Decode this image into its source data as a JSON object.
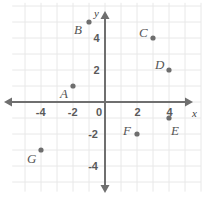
{
  "chart_data": {
    "type": "scatter",
    "title": "",
    "xlabel": "x",
    "ylabel": "y",
    "xlim": [
      -5.8,
      6.0
    ],
    "ylim": [
      -5.6,
      6.2
    ],
    "grid": true,
    "grid_step": 1,
    "axis_tick_step": 2,
    "xticks": [
      -4,
      -2,
      0,
      2,
      4
    ],
    "xtick_labels": [
      "-4",
      "-2",
      "0",
      "2",
      "4"
    ],
    "yticks": [
      4,
      2,
      -2,
      -4
    ],
    "ytick_labels": [
      "4",
      "2",
      "-2",
      "-4"
    ],
    "origin_label": "0",
    "legend": null,
    "points": [
      {
        "name": "A",
        "x": -2,
        "y": 1,
        "label_dx": -13,
        "label_dy": 7
      },
      {
        "name": "B",
        "x": -1,
        "y": 5,
        "label_dx": -15,
        "label_dy": 7
      },
      {
        "name": "C",
        "x": 3,
        "y": 4,
        "label_dx": -14,
        "label_dy": -6
      },
      {
        "name": "D",
        "x": 4,
        "y": 2,
        "label_dx": -14,
        "label_dy": -6
      },
      {
        "name": "E",
        "x": 4,
        "y": -1,
        "label_dx": 2,
        "label_dy": 12
      },
      {
        "name": "F",
        "x": 2,
        "y": -2,
        "label_dx": -14,
        "label_dy": -4
      },
      {
        "name": "G",
        "x": -4,
        "y": -3,
        "label_dx": -14,
        "label_dy": 8
      }
    ]
  },
  "colors": {
    "background": "#ffffff",
    "grid": "#e8e8e8",
    "axis": "#6f6f6f",
    "point": "#6e6e6e",
    "label_text": "#555555",
    "tick_text": "#5a5a5a"
  }
}
